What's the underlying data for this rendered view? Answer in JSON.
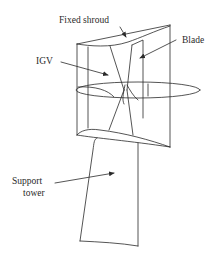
{
  "figure": {
    "type": "diagram",
    "stroke_color": "#2a2a2a",
    "background": "#ffffff"
  },
  "labels": {
    "fixed_shroud": "Fixed shroud",
    "blade": "Blade",
    "igv": "IGV",
    "support_tower_line1": "Support",
    "support_tower_line2": "tower"
  },
  "components": [
    {
      "name": "Fixed shroud",
      "pointer": "top edge of shroud"
    },
    {
      "name": "Blade",
      "pointer": "rotor blade inside shroud"
    },
    {
      "name": "IGV",
      "pointer": "inlet guide vane"
    },
    {
      "name": "Support tower",
      "pointer": "tower below shroud"
    }
  ]
}
